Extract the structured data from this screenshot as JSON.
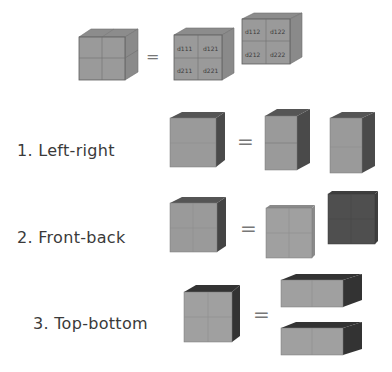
{
  "title_row": {
    "equals": "=",
    "front_cube_labels": [
      "d111",
      "d121",
      "d211",
      "d221"
    ],
    "back_cube_labels": [
      "d112",
      "d122",
      "d212",
      "d222"
    ]
  },
  "rows": [
    {
      "label": "1.  Left-right",
      "equals": "="
    },
    {
      "label": "2.  Front-back",
      "equals": "="
    },
    {
      "label": "3.  Top-bottom",
      "equals": "="
    }
  ],
  "colors": {
    "face": "#9a9a9a",
    "face_light": "#a8a8a8",
    "side": "#7c7c7c",
    "top": "#8c8c8c",
    "dark_side": "#3e3e3e",
    "dark_face": "#4f4f4f",
    "grid_line": "#6e6e6e",
    "text": "#3a3a3a"
  }
}
